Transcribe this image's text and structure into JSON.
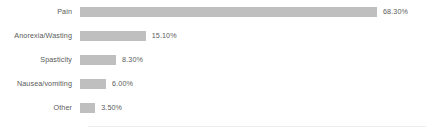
{
  "chart_data": {
    "type": "bar",
    "orientation": "horizontal",
    "title": "",
    "subtitle": "",
    "xlabel": "",
    "ylabel": "",
    "categories": [
      "Pain",
      "Anorexia/Wasting",
      "Spasticity",
      "Nausea/vomiting",
      "Other"
    ],
    "values": [
      68.3,
      15.1,
      8.3,
      6.0,
      3.5
    ],
    "value_labels": [
      "68.30%",
      "15.10%",
      "8.30%",
      "6.00%",
      "3.50%"
    ],
    "xlim": [
      0,
      68.3
    ],
    "grid": false,
    "legend": null,
    "series": [
      {
        "name": "",
        "values": [
          68.3,
          15.1,
          8.3,
          6.0,
          3.5
        ]
      }
    ],
    "colors": {
      "bar": "#bfbfbf",
      "text": "#5a5a5a",
      "background": "#ffffff",
      "axis": "#ededed"
    }
  }
}
